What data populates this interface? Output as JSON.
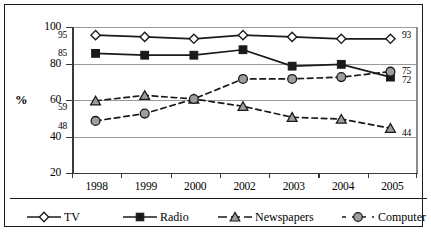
{
  "chart_data": {
    "type": "line",
    "title": "",
    "xlabel": "",
    "ylabel": "%",
    "ylim": [
      20,
      100
    ],
    "yticks": [
      20,
      40,
      60,
      80,
      100
    ],
    "grid": true,
    "legend_position": "bottom",
    "categories": [
      "1998",
      "1999",
      "2000",
      "2002",
      "2003",
      "2004",
      "2005"
    ],
    "series": [
      {
        "name": "TV",
        "marker": "open-diamond",
        "line": "solid",
        "color": "#1a1a1a",
        "values": [
          95,
          94,
          93,
          95,
          94,
          93,
          93
        ],
        "start_label": "95",
        "end_label": "93"
      },
      {
        "name": "Radio",
        "marker": "filled-square",
        "line": "solid",
        "color": "#1a1a1a",
        "values": [
          85,
          84,
          84,
          87,
          78,
          79,
          72
        ],
        "start_label": "85",
        "end_label": "72"
      },
      {
        "name": "Newspapers",
        "marker": "gray-triangle",
        "line": "dashed",
        "color": "#1a1a1a",
        "values": [
          59,
          62,
          60,
          56,
          50,
          49,
          44
        ],
        "start_label": "59",
        "end_label": "44"
      },
      {
        "name": "Computer",
        "marker": "gray-circle",
        "line": "dashed",
        "color": "#1a1a1a",
        "values": [
          48,
          52,
          60,
          71,
          71,
          72,
          75
        ],
        "start_label": "48",
        "end_label": "75"
      }
    ]
  },
  "axis": {
    "y_tick_labels": [
      "100",
      "80",
      "60",
      "40",
      "20"
    ],
    "x_tick_labels": [
      "1998",
      "1999",
      "2000",
      "2002",
      "2003",
      "2004",
      "2005"
    ],
    "y_axis_title": "%"
  },
  "legend": {
    "items": [
      {
        "label": "TV",
        "marker": "open-diamond",
        "line": "solid"
      },
      {
        "label": "Radio",
        "marker": "filled-square",
        "line": "solid"
      },
      {
        "label": "Newspapers",
        "marker": "gray-triangle",
        "line": "dashed"
      },
      {
        "label": "Computer",
        "marker": "gray-circle",
        "line": "dashed"
      }
    ]
  },
  "labels": {
    "left": [
      "95",
      "85",
      "59",
      "48"
    ],
    "right": [
      "93",
      "75",
      "72",
      "44"
    ]
  },
  "colors": {
    "line": "#1a1a1a",
    "marker_fill_gray": "#9e9e9e",
    "marker_fill_white": "#ffffff",
    "grid": "#9a9a9a",
    "frame": "#1a1a1a"
  }
}
